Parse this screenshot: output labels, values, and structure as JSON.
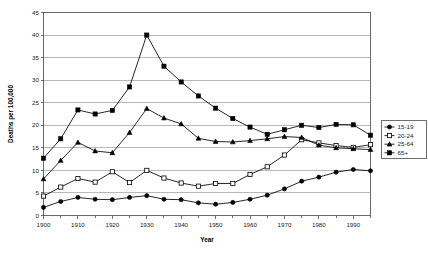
{
  "chart_data": {
    "type": "line",
    "title": "",
    "xlabel": "Year",
    "ylabel": "Deaths per 100,000",
    "xlim": [
      1900,
      1995
    ],
    "ylim": [
      0,
      45
    ],
    "ytick_step": 5,
    "xtick_step": 10,
    "grid": true,
    "grid_axis": "y",
    "legend_position": "right",
    "x": [
      1900,
      1905,
      1910,
      1915,
      1920,
      1925,
      1930,
      1935,
      1940,
      1945,
      1950,
      1955,
      1960,
      1965,
      1970,
      1975,
      1980,
      1985,
      1990,
      1995
    ],
    "series": [
      {
        "name": "15-19",
        "marker": "filled-circle",
        "values": [
          1.8,
          3.1,
          4.0,
          3.6,
          3.5,
          4.0,
          4.4,
          3.6,
          3.5,
          2.8,
          2.5,
          2.9,
          3.6,
          4.5,
          5.9,
          7.6,
          8.5,
          9.6,
          10.2,
          9.9
        ]
      },
      {
        "name": "20-24",
        "marker": "open-square",
        "values": [
          4.3,
          6.3,
          8.2,
          7.4,
          9.7,
          7.3,
          10.0,
          8.3,
          7.2,
          6.5,
          7.1,
          7.1,
          9.1,
          10.8,
          13.4,
          16.8,
          16.1,
          15.5,
          15.1,
          15.7
        ]
      },
      {
        "name": "25-64",
        "marker": "filled-triangle",
        "values": [
          8.1,
          12.2,
          16.2,
          14.3,
          13.9,
          18.4,
          23.7,
          21.6,
          20.3,
          17.1,
          16.4,
          16.3,
          16.6,
          17.0,
          17.5,
          17.3,
          15.6,
          15.0,
          14.8,
          14.6
        ]
      },
      {
        "name": "65+",
        "marker": "filled-square",
        "values": [
          12.7,
          17.0,
          23.4,
          22.5,
          23.3,
          28.5,
          40.0,
          33.1,
          29.6,
          26.5,
          23.8,
          21.5,
          19.6,
          18.0,
          19.0,
          20.0,
          19.5,
          20.2,
          20.1,
          17.8
        ]
      }
    ],
    "xtick_labels": [
      "1900",
      "1910",
      "1920",
      "1930",
      "1940",
      "1950",
      "1960",
      "1970",
      "1980",
      "1990"
    ],
    "ytick_labels": [
      "0",
      "5",
      "10",
      "15",
      "20",
      "25",
      "30",
      "35",
      "40",
      "45"
    ],
    "legend_entries": [
      "15-19",
      "20-24",
      "25-64",
      "65+"
    ],
    "line_color": "#000000"
  }
}
